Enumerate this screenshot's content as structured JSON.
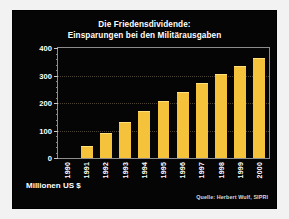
{
  "figure": {
    "background_color": "#f2f2f2",
    "panel_color": "#050505"
  },
  "chart_data": {
    "type": "bar",
    "title": "Die Friedensdividende: Einsparungen bei den Militärausgaben",
    "title_line1": "Die Friedensdividende:",
    "title_line2": "Einsparungen bei den Militärausgaben",
    "categories": [
      "1990",
      "1991",
      "1992",
      "1993",
      "1994",
      "1995",
      "1996",
      "1997",
      "1998",
      "1999",
      "2000"
    ],
    "values": [
      0,
      45,
      90,
      130,
      170,
      208,
      240,
      272,
      305,
      335,
      365
    ],
    "xlabel": "",
    "ylabel": "Millionen US $",
    "ylim": [
      0,
      400
    ],
    "yticks": [
      0,
      100,
      200,
      300,
      400
    ],
    "ytick_labels": [
      "0",
      "100",
      "200",
      "300",
      "400"
    ],
    "grid": true,
    "legend": false,
    "bar_color": "#f5c33b",
    "text_color": "#ffffff",
    "annotations": [
      "Millionen US $",
      "Quelle: Herbert Wulf, SIPRI"
    ]
  },
  "footer": {
    "unit": "Millionen US $",
    "source": "Quelle: Herbert Wulf, SIPRI"
  }
}
